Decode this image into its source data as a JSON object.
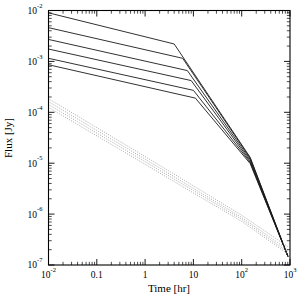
{
  "chart_data": {
    "type": "line",
    "title": "",
    "xlabel": "Time [hr]",
    "ylabel": "Flux [Jy]",
    "xscale": "log",
    "yscale": "log",
    "xlim": [
      0.01,
      1000
    ],
    "ylim": [
      1e-07,
      0.01
    ],
    "grid": false,
    "legend": null,
    "xtick_labels": [
      "10",
      "0.1",
      "1",
      "10",
      "10",
      "10"
    ],
    "xtick_exponents": [
      "-2",
      "",
      "",
      "",
      "2",
      "3"
    ],
    "xtick_values": [
      0.01,
      0.1,
      1,
      10,
      100,
      1000
    ],
    "ytick_labels": [
      "10",
      "10",
      "10",
      "10",
      "10",
      "10"
    ],
    "ytick_exponents": [
      "-2",
      "-3",
      "-4",
      "-5",
      "-6",
      "-7"
    ],
    "ytick_values": [
      0.01,
      0.001,
      0.0001,
      1e-05,
      1e-06,
      1e-07
    ],
    "series": [
      {
        "name": "solid-1",
        "style": "solid",
        "color": "#1a1a1a",
        "x": [
          0.01,
          4.0,
          150.0,
          900.0
        ],
        "y": [
          0.009,
          0.0022,
          1.3e-05,
          1.5e-07
        ]
      },
      {
        "name": "solid-2",
        "style": "solid",
        "color": "#1a1a1a",
        "x": [
          0.01,
          6.0,
          150.0,
          900.0
        ],
        "y": [
          0.0046,
          0.00115,
          1.25e-05,
          1.5e-07
        ]
      },
      {
        "name": "solid-3",
        "style": "solid",
        "color": "#1a1a1a",
        "x": [
          0.01,
          7.5,
          150.0,
          900.0
        ],
        "y": [
          0.0027,
          0.00066,
          1.18e-05,
          1.5e-07
        ]
      },
      {
        "name": "solid-4",
        "style": "solid",
        "color": "#1a1a1a",
        "x": [
          0.01,
          9.0,
          150.0,
          900.0
        ],
        "y": [
          0.00175,
          0.00042,
          1.1e-05,
          1.5e-07
        ]
      },
      {
        "name": "solid-5",
        "style": "solid",
        "color": "#1a1a1a",
        "x": [
          0.01,
          10.0,
          150.0,
          900.0
        ],
        "y": [
          0.00115,
          0.00027,
          1.04e-05,
          1.5e-07
        ]
      },
      {
        "name": "solid-6",
        "style": "solid",
        "color": "#1a1a1a",
        "x": [
          0.01,
          11.0,
          150.0,
          900.0
        ],
        "y": [
          0.00086,
          0.00019,
          9.8e-06,
          1.5e-07
        ]
      },
      {
        "name": "dotted-1",
        "style": "dotted",
        "color": "#9a9a9a",
        "x": [
          0.01,
          0.1,
          1.0,
          10.0,
          100.0,
          900.0
        ],
        "y": [
          0.000185,
          5e-05,
          1.35e-05,
          3.6e-06,
          9.5e-07,
          2.3e-07
        ]
      },
      {
        "name": "dotted-2",
        "style": "dotted",
        "color": "#9a9a9a",
        "x": [
          0.01,
          0.1,
          1.0,
          10.0,
          100.0,
          900.0
        ],
        "y": [
          0.000162,
          4.4e-05,
          1.2e-05,
          3.2e-06,
          8.6e-07,
          2e-07
        ]
      },
      {
        "name": "dotted-3",
        "style": "dotted",
        "color": "#9a9a9a",
        "x": [
          0.01,
          0.1,
          1.0,
          10.0,
          100.0,
          900.0
        ],
        "y": [
          0.000142,
          3.9e-05,
          1.07e-05,
          2.9e-06,
          7.9e-07,
          1.8e-07
        ]
      },
      {
        "name": "dotted-4",
        "style": "dotted",
        "color": "#9a9a9a",
        "x": [
          0.01,
          0.1,
          1.0,
          10.0,
          100.0,
          900.0
        ],
        "y": [
          0.000125,
          3.45e-05,
          9.5e-06,
          2.6e-06,
          7.2e-07,
          1.65e-07
        ]
      }
    ]
  }
}
